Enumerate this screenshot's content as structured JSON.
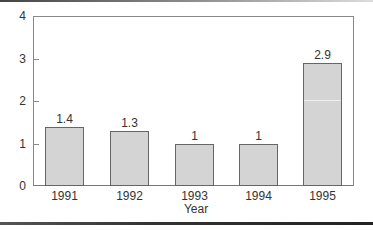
{
  "chart_data": {
    "type": "bar",
    "title": "",
    "xlabel": "Year",
    "ylabel": "",
    "categories": [
      "1991",
      "1992",
      "1993",
      "1994",
      "1995"
    ],
    "values": [
      1.4,
      1.3,
      1,
      1,
      2.9
    ],
    "data_labels": [
      "1.4",
      "1.3",
      "1",
      "1",
      "2.9"
    ],
    "y_ticks": [
      "0",
      "1",
      "2",
      "3",
      "4"
    ],
    "ylim": [
      0,
      4
    ],
    "grid": false,
    "legend": null,
    "bar_color": "#d4d4d4",
    "bar_edge_color": "#666666"
  }
}
